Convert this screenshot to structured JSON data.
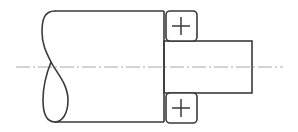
{
  "diagram": {
    "type": "engineering-drawing",
    "colors": {
      "outline": "#3a3a3a",
      "centerline": "#a8a8a8",
      "background": "#ffffff"
    },
    "elements": {
      "main_shaft": {
        "label": "large-diameter shaft section (broken view)"
      },
      "stepped_shaft": {
        "label": "small-diameter shaft step"
      },
      "centerline": {
        "label": "axis center line (dash-dot)"
      },
      "break_symbol": {
        "label": "shaft break (S-curve loop)"
      },
      "marker_top": {
        "symbol": "+",
        "label": "feature marker top"
      },
      "marker_bottom": {
        "symbol": "+",
        "label": "feature marker bottom"
      }
    }
  }
}
